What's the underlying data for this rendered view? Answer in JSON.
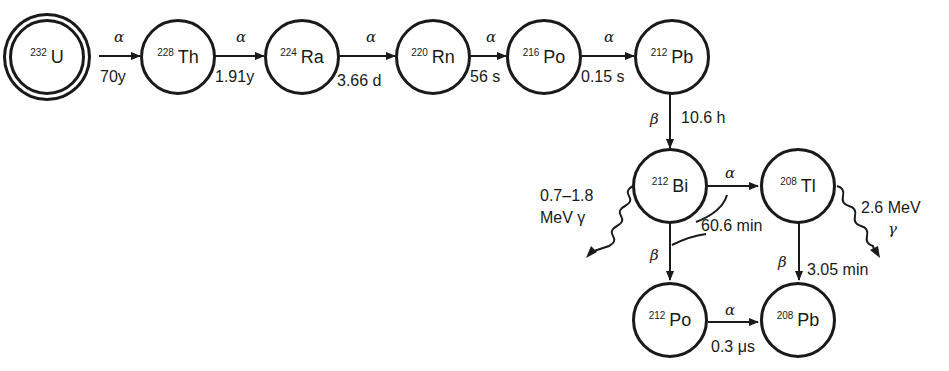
{
  "diagram": {
    "colors": {
      "ink": "#1a1a1a",
      "background": "#ffffff"
    },
    "nodes": [
      {
        "id": "u232",
        "mass": "232",
        "symbol": "U",
        "parent": true
      },
      {
        "id": "th228",
        "mass": "228",
        "symbol": "Th"
      },
      {
        "id": "ra224",
        "mass": "224",
        "symbol": "Ra"
      },
      {
        "id": "rn220",
        "mass": "220",
        "symbol": "Rn"
      },
      {
        "id": "po216",
        "mass": "216",
        "symbol": "Po"
      },
      {
        "id": "pb212",
        "mass": "212",
        "symbol": "Pb"
      },
      {
        "id": "bi212",
        "mass": "212",
        "symbol": "Bi"
      },
      {
        "id": "tl208",
        "mass": "208",
        "symbol": "Tl"
      },
      {
        "id": "po212",
        "mass": "212",
        "symbol": "Po"
      },
      {
        "id": "pb208",
        "mass": "208",
        "symbol": "Pb"
      }
    ],
    "decays": [
      {
        "from": "U-232",
        "to": "Th-228",
        "mode": "α",
        "half_life": "70y"
      },
      {
        "from": "Th-228",
        "to": "Ra-224",
        "mode": "α",
        "half_life": "1.91y"
      },
      {
        "from": "Ra-224",
        "to": "Rn-220",
        "mode": "α",
        "half_life": "3.66 d"
      },
      {
        "from": "Rn-220",
        "to": "Po-216",
        "mode": "α",
        "half_life": "56 s"
      },
      {
        "from": "Po-216",
        "to": "Pb-212",
        "mode": "α",
        "half_life": "0.15 s"
      },
      {
        "from": "Pb-212",
        "to": "Bi-212",
        "mode": "β",
        "half_life": "10.6 h"
      },
      {
        "from": "Bi-212",
        "to": "Tl-208",
        "mode": "α",
        "half_life": "60.6 min"
      },
      {
        "from": "Bi-212",
        "to": "Po-212",
        "mode": "β",
        "half_life": ""
      },
      {
        "from": "Tl-208",
        "to": "Pb-208",
        "mode": "β",
        "half_life": "3.05 min"
      },
      {
        "from": "Po-212",
        "to": "Pb-208",
        "mode": "α",
        "half_life": "0.3 μs"
      }
    ],
    "gammas": [
      {
        "source": "Bi-212",
        "energy_line1": "0.7–1.8",
        "energy_line2": "MeV γ"
      },
      {
        "source": "Tl-208",
        "energy_line1": "2.6 MeV",
        "energy_line2": "γ"
      }
    ]
  }
}
